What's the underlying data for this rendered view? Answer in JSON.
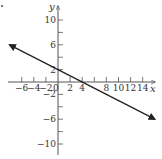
{
  "chart_data": {
    "type": "line",
    "title": "",
    "xlabel": "x",
    "ylabel": "y",
    "xlim": [
      -8,
      16
    ],
    "ylim": [
      -12,
      12
    ],
    "grid": false,
    "x_ticks": [
      -6,
      -4,
      -2,
      0,
      2,
      4,
      6,
      8,
      10,
      12,
      14
    ],
    "x_tick_labels": [
      "-6",
      "-4",
      "-2",
      "0",
      "2",
      "4",
      "",
      "8",
      "10",
      "12",
      "14"
    ],
    "y_ticks": [
      10,
      8,
      6,
      4,
      2,
      -2,
      -4,
      -6,
      -8,
      -10
    ],
    "y_tick_labels": [
      "10",
      "",
      "6",
      "",
      "2",
      "-2",
      "",
      "-6",
      "",
      "-10"
    ],
    "series": [
      {
        "name": "line",
        "equation": "y = -x/2 + 2",
        "x": [
          -8,
          0,
          4,
          16
        ],
        "y": [
          6,
          2,
          0,
          -6
        ],
        "arrows_both_ends": true,
        "color": "#222222"
      }
    ]
  },
  "labels": {
    "x_axis": "x",
    "y_axis": "y",
    "corner_mark": "."
  },
  "ticks": {
    "x": [
      {
        "v": -6,
        "t": "−6"
      },
      {
        "v": -4,
        "t": "−4"
      },
      {
        "v": -2,
        "t": "−2"
      },
      {
        "v": 0,
        "t": "0"
      },
      {
        "v": 2,
        "t": "2"
      },
      {
        "v": 4,
        "t": "4"
      },
      {
        "v": 8,
        "t": "8"
      },
      {
        "v": 10,
        "t": "10"
      },
      {
        "v": 12,
        "t": "12"
      },
      {
        "v": 14,
        "t": "14"
      }
    ],
    "y": [
      {
        "v": 10,
        "t": "10"
      },
      {
        "v": 6,
        "t": "6"
      },
      {
        "v": 2,
        "t": "2"
      },
      {
        "v": -2,
        "t": "−2"
      },
      {
        "v": -6,
        "t": "−6"
      },
      {
        "v": -10,
        "t": "−10"
      }
    ]
  }
}
